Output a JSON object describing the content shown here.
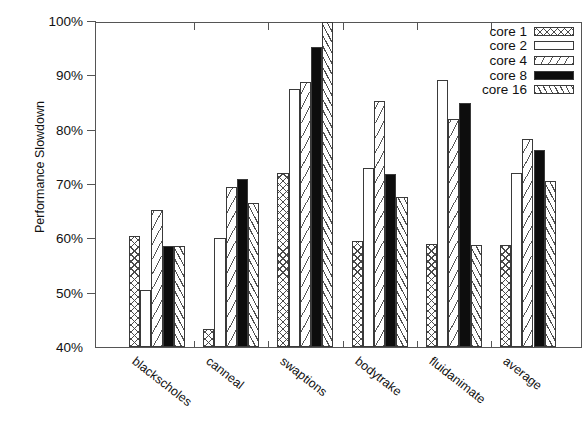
{
  "chart_data": {
    "type": "bar",
    "title": "",
    "xlabel": "",
    "ylabel": "Performance Slowdown",
    "ylim": [
      40,
      100
    ],
    "ytick_labels": [
      "40%",
      "50%",
      "60%",
      "70%",
      "80%",
      "90%",
      "100%"
    ],
    "ytick_values": [
      40,
      50,
      60,
      70,
      80,
      90,
      100
    ],
    "grid": false,
    "legend_position": "top-right",
    "categories": [
      "blackscholes",
      "canneal",
      "swaptions",
      "bodytrake",
      "fluidanimate",
      "average"
    ],
    "series": [
      {
        "name": "core 1",
        "pattern": "cross-hatch",
        "values": [
          60.5,
          43.3,
          72.0,
          59.5,
          59.0,
          58.8
        ]
      },
      {
        "name": "core 2",
        "pattern": "solid-white",
        "values": [
          50.5,
          60.0,
          87.5,
          73.0,
          89.2,
          72.0
        ]
      },
      {
        "name": "core 4",
        "pattern": "diagonal-backslash",
        "values": [
          65.3,
          69.5,
          88.8,
          85.2,
          82.0,
          78.3
        ]
      },
      {
        "name": "core 8",
        "pattern": "solid-black",
        "values": [
          58.5,
          71.0,
          95.3,
          71.8,
          85.0,
          76.2
        ]
      },
      {
        "name": "core 16",
        "pattern": "diagonal-slash-dense",
        "values": [
          58.5,
          66.5,
          99.8,
          67.7,
          58.7,
          70.5
        ]
      }
    ]
  },
  "legend": {
    "items": [
      {
        "label": "core 1"
      },
      {
        "label": "core 2"
      },
      {
        "label": "core 4"
      },
      {
        "label": "core 8"
      },
      {
        "label": "core 16"
      }
    ]
  },
  "colors": {
    "axis": "#555555",
    "text": "#111111",
    "bar_outline": "#3a3a3a",
    "hatch": "#4a4a4a",
    "solid_black": "#0d0d0d",
    "background": "#ffffff"
  }
}
